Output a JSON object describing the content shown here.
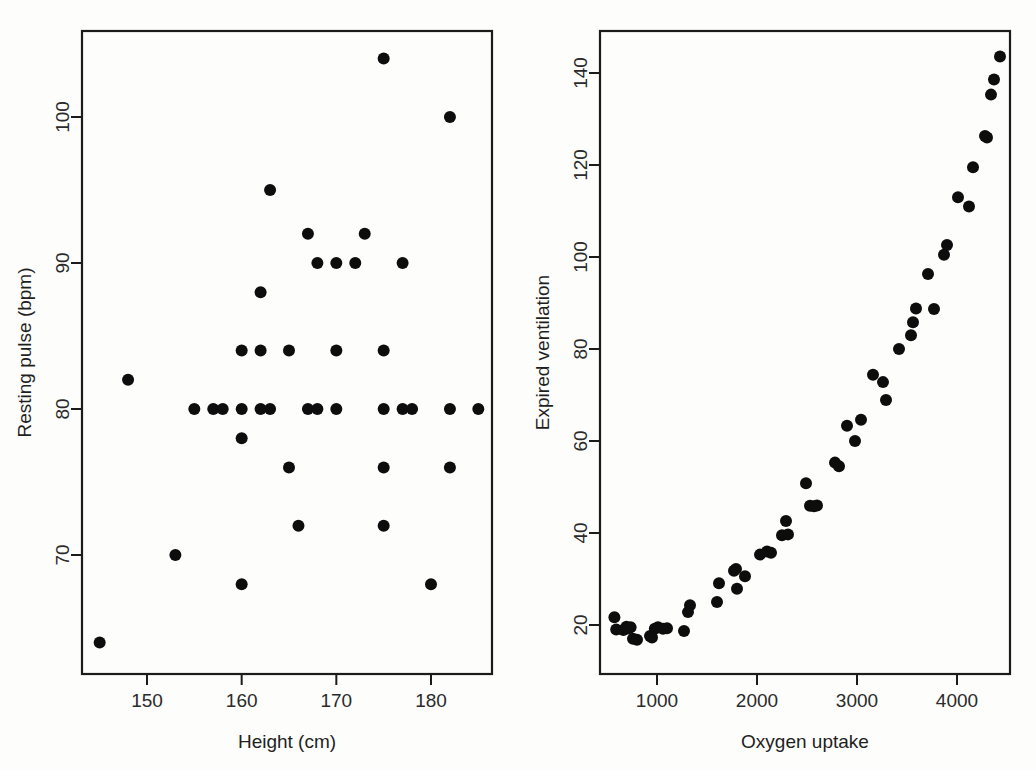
{
  "figure": {
    "background_color": "#fdfdfc",
    "ink_color": "#0d0d0d",
    "panel_count": 2
  },
  "panels": [
    {
      "id": "left",
      "name": "height-vs-resting-pulse",
      "xlabel": "Height (cm)",
      "ylabel": "Resting pulse (bpm)",
      "xticks": [
        "150",
        "160",
        "170",
        "180"
      ],
      "yticks": [
        "70",
        "80",
        "90",
        "100"
      ]
    },
    {
      "id": "right",
      "name": "oxygen-uptake-vs-expired-ventilation",
      "xlabel": "Oxygen uptake",
      "ylabel": "Expired ventilation",
      "xticks": [
        "1000",
        "2000",
        "3000",
        "4000"
      ],
      "yticks": [
        "20",
        "40",
        "60",
        "80",
        "100",
        "120",
        "140"
      ]
    }
  ],
  "chart_data": [
    {
      "type": "scatter",
      "panel": "left",
      "title": "",
      "xlabel": "Height (cm)",
      "ylabel": "Resting pulse (bpm)",
      "xlim": [
        144,
        186
      ],
      "ylim": [
        63,
        105
      ],
      "xticks": [
        150,
        160,
        170,
        180
      ],
      "yticks": [
        70,
        80,
        90,
        100
      ],
      "grid": false,
      "legend": "none",
      "marker": "filled-circle",
      "marker_color": "#0d0d0d",
      "points": [
        [
          145,
          64
        ],
        [
          148,
          82
        ],
        [
          153,
          70
        ],
        [
          155,
          80
        ],
        [
          157,
          80
        ],
        [
          158,
          80
        ],
        [
          160,
          80
        ],
        [
          160,
          84
        ],
        [
          160,
          78
        ],
        [
          160,
          68
        ],
        [
          162,
          80
        ],
        [
          162,
          84
        ],
        [
          162,
          88
        ],
        [
          163,
          80
        ],
        [
          163,
          95
        ],
        [
          165,
          84
        ],
        [
          165,
          76
        ],
        [
          166,
          72
        ],
        [
          167,
          80
        ],
        [
          167,
          92
        ],
        [
          168,
          80
        ],
        [
          168,
          90
        ],
        [
          170,
          80
        ],
        [
          170,
          84
        ],
        [
          170,
          90
        ],
        [
          172,
          90
        ],
        [
          173,
          92
        ],
        [
          175,
          80
        ],
        [
          175,
          84
        ],
        [
          175,
          104
        ],
        [
          175,
          76
        ],
        [
          175,
          72
        ],
        [
          177,
          80
        ],
        [
          177,
          90
        ],
        [
          178,
          80
        ],
        [
          180,
          68
        ],
        [
          182,
          80
        ],
        [
          182,
          100
        ],
        [
          182,
          76
        ],
        [
          185,
          80
        ]
      ]
    },
    {
      "type": "scatter",
      "panel": "right",
      "title": "",
      "xlabel": "Oxygen uptake",
      "ylabel": "Expired ventilation",
      "xlim": [
        420,
        4520
      ],
      "ylim": [
        12,
        150
      ],
      "xticks": [
        1000,
        2000,
        3000,
        4000
      ],
      "yticks": [
        20,
        40,
        60,
        80,
        100,
        120,
        140
      ],
      "grid": false,
      "legend": "none",
      "marker": "filled-circle",
      "marker_color": "#0d0d0d",
      "points": [
        [
          574,
          21.7
        ],
        [
          592,
          19.0
        ],
        [
          664,
          18.9
        ],
        [
          694,
          19.6
        ],
        [
          714,
          19.3
        ],
        [
          736,
          19.5
        ],
        [
          760,
          17.0
        ],
        [
          800,
          16.8
        ],
        [
          930,
          17.6
        ],
        [
          950,
          17.3
        ],
        [
          978,
          19.2
        ],
        [
          1010,
          19.5
        ],
        [
          1060,
          19.2
        ],
        [
          1100,
          19.3
        ],
        [
          1270,
          18.7
        ],
        [
          1310,
          22.8
        ],
        [
          1330,
          24.3
        ],
        [
          1600,
          25.0
        ],
        [
          1620,
          29.1
        ],
        [
          1770,
          31.8
        ],
        [
          1790,
          32.2
        ],
        [
          1800,
          27.9
        ],
        [
          1880,
          30.6
        ],
        [
          2030,
          35.3
        ],
        [
          2100,
          36.0
        ],
        [
          2140,
          35.7
        ],
        [
          2250,
          39.5
        ],
        [
          2290,
          42.6
        ],
        [
          2310,
          39.7
        ],
        [
          2490,
          50.8
        ],
        [
          2530,
          45.9
        ],
        [
          2570,
          45.8
        ],
        [
          2600,
          46.0
        ],
        [
          2780,
          55.3
        ],
        [
          2820,
          54.5
        ],
        [
          2900,
          63.3
        ],
        [
          2980,
          60.0
        ],
        [
          3040,
          64.6
        ],
        [
          3160,
          74.4
        ],
        [
          3260,
          72.8
        ],
        [
          3290,
          68.9
        ],
        [
          3420,
          80.0
        ],
        [
          3540,
          83.0
        ],
        [
          3560,
          85.8
        ],
        [
          3590,
          88.8
        ],
        [
          3770,
          88.7
        ],
        [
          3710,
          96.3
        ],
        [
          3870,
          100.5
        ],
        [
          3900,
          102.6
        ],
        [
          4010,
          113.0
        ],
        [
          4120,
          111.0
        ],
        [
          4160,
          119.5
        ],
        [
          4280,
          126.3
        ],
        [
          4300,
          126.0
        ],
        [
          4340,
          135.3
        ],
        [
          4370,
          138.6
        ],
        [
          4430,
          143.6
        ]
      ]
    }
  ]
}
